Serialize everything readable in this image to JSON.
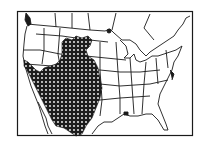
{
  "figure": {
    "type": "range-map",
    "region": "North America (United States, southern Canada, northern Mexico)",
    "shaded_region_description": "Stippled range covering the western United States from the northern Rockies/Great Plains south through the Great Basin, Southwest and into northern Mexico, plus coastal California",
    "colors": {
      "background": "#ffffff",
      "outline": "#1a1a1a",
      "range_fill": "#1c1c1c",
      "range_dots": "#ffffff"
    },
    "legend": null
  }
}
